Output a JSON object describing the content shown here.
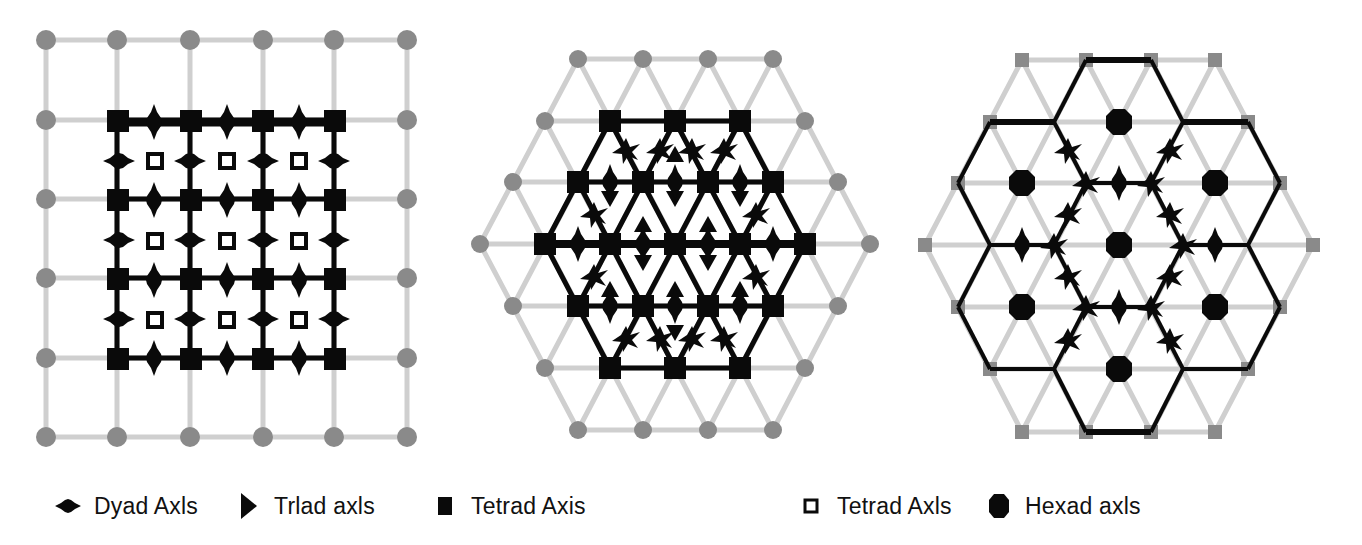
{
  "figure": {
    "colors": {
      "lattice_line": "#cfcfcf",
      "lattice_node": "#8a8a8a",
      "symmetry": "#0a0a0a",
      "background": "#ffffff"
    },
    "panels": [
      {
        "id": "square-lattice",
        "lattice": "square",
        "symmetry_elements": [
          "tetrad-solid",
          "tetrad-open",
          "dyad"
        ]
      },
      {
        "id": "triangular-lattice",
        "lattice": "triangular",
        "symmetry_elements": [
          "hexad-node",
          "triad",
          "dyad"
        ]
      },
      {
        "id": "hexagonal-lattice",
        "lattice": "triangular",
        "symmetry_elements": [
          "hexad",
          "triad",
          "dyad"
        ]
      }
    ]
  },
  "legend": {
    "items": [
      {
        "icon": "dyad-axis-icon",
        "label": "Dyad Axls"
      },
      {
        "icon": "triad-axis-icon",
        "label": "Trlad axls"
      },
      {
        "icon": "tetrad-axis-solid-icon",
        "label": "Tetrad Axis"
      },
      {
        "icon": "tetrad-axis-open-icon",
        "label": "Tetrad Axls"
      },
      {
        "icon": "hexad-axis-icon",
        "label": "Hexad axls"
      }
    ]
  }
}
